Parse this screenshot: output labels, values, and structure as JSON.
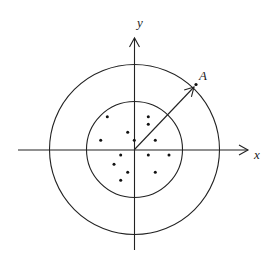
{
  "diagram": {
    "type": "concentric-circles-with-axes",
    "center": {
      "x": 134.5,
      "y": 149.5
    },
    "outer_circle_radius": 85,
    "inner_circle_radius": 48,
    "axes": {
      "x_label": "x",
      "y_label": "y",
      "x_start": 18,
      "x_end": 248,
      "y_start": 250,
      "y_end": 38
    },
    "vector": {
      "from": {
        "x": 134.5,
        "y": 149.5
      },
      "to": {
        "x": 194,
        "y": 87
      }
    },
    "point_A": {
      "label": "A",
      "x": 196,
      "y": 84.5
    },
    "points": [
      {
        "x": 107.3,
        "y": 116.7
      },
      {
        "x": 148.3,
        "y": 116.7
      },
      {
        "x": 148.3,
        "y": 124.3
      },
      {
        "x": 127.7,
        "y": 132.3
      },
      {
        "x": 100.7,
        "y": 140.3
      },
      {
        "x": 134.3,
        "y": 140.3
      },
      {
        "x": 155.3,
        "y": 140.3
      },
      {
        "x": 120.7,
        "y": 155
      },
      {
        "x": 148.3,
        "y": 155
      },
      {
        "x": 169,
        "y": 155
      },
      {
        "x": 114,
        "y": 164.3
      },
      {
        "x": 127.7,
        "y": 172.3
      },
      {
        "x": 155.3,
        "y": 172.3
      },
      {
        "x": 120.7,
        "y": 180.3
      }
    ],
    "colors": {
      "line": "#222222",
      "background": "#ffffff"
    }
  }
}
